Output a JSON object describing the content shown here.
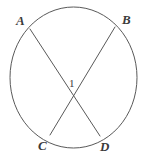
{
  "figure": {
    "kind": "circle-with-two-intersecting-chords",
    "background_color": "#ffffff",
    "stroke_color": "#595959",
    "label_color": "#3b3b3b",
    "circle": {
      "name": "circle-outline",
      "center_x": 73.5,
      "center_y": 77.5,
      "radius_x": 63.5,
      "radius_y": 70.5,
      "stroke_width": 1
    },
    "chords": [
      {
        "name": "chord-AD",
        "from_label": "A",
        "to_label": "D",
        "x1": 30,
        "y1": 29,
        "x2": 100,
        "y2": 136
      },
      {
        "name": "chord-BC",
        "from_label": "B",
        "to_label": "C",
        "x1": 115,
        "y1": 27,
        "x2": 50,
        "y2": 135
      }
    ],
    "intersection": {
      "name": "chord-intersection-point",
      "x": 73,
      "y": 96
    },
    "labels": {
      "a": "A",
      "b": "B",
      "c": "C",
      "d": "D",
      "angle_1": "1"
    }
  }
}
